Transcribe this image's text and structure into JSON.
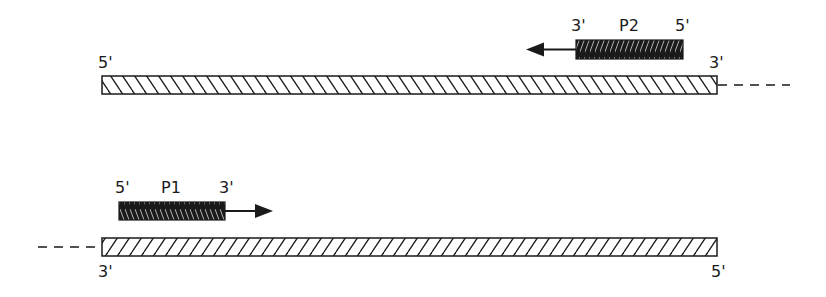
{
  "top_strand": {
    "left_label": "5'",
    "right_label": "3'",
    "primer": {
      "name": "P2",
      "left_label": "3'",
      "right_label": "5'",
      "direction": "left"
    }
  },
  "bottom_strand": {
    "left_label": "3'",
    "right_label": "5'",
    "primer": {
      "name": "P1",
      "left_label": "5'",
      "right_label": "3'",
      "direction": "right"
    }
  },
  "colors": {
    "line": "#1a1a1a",
    "primer_fill": "#1a1a1a",
    "background": "#ffffff"
  }
}
